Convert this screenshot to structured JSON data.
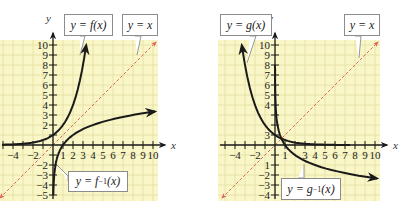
{
  "chart_data": [
    {
      "type": "line",
      "title": "",
      "xlabel": "x",
      "ylabel": "y",
      "xlim": [
        -5,
        10
      ],
      "ylim": [
        -5,
        10
      ],
      "grid": true,
      "x_ticks": [
        -4,
        -2,
        1,
        2,
        3,
        4,
        5,
        6,
        7,
        8,
        9,
        10
      ],
      "y_ticks": [
        -5,
        -4,
        -3,
        -2,
        2,
        3,
        4,
        5,
        6,
        7,
        8,
        9,
        10
      ],
      "series": [
        {
          "name": "y = f(x)",
          "kind": "exponential",
          "base": 2,
          "x": [
            -5,
            -4,
            -3,
            -2,
            -1,
            0,
            1,
            2,
            3,
            3.32
          ],
          "y": [
            0.03,
            0.06,
            0.13,
            0.25,
            0.5,
            1,
            2,
            4,
            8,
            10
          ]
        },
        {
          "name": "y = f^-1(x)",
          "kind": "logarithmic",
          "base": 2,
          "x": [
            0.03,
            0.06,
            0.13,
            0.25,
            0.5,
            1,
            2,
            4,
            8,
            10
          ],
          "y": [
            -5,
            -4,
            -3,
            -2,
            -1,
            0,
            1,
            2,
            3,
            3.32
          ]
        },
        {
          "name": "y = x",
          "kind": "reference",
          "style": "dashed",
          "color": "#e0655a",
          "x": [
            -5,
            10
          ],
          "y": [
            -5,
            10
          ]
        }
      ],
      "annotations": [
        {
          "text": "y = f(x)",
          "target": "f"
        },
        {
          "text": "y = x",
          "target": "identity"
        },
        {
          "text": "y = f^-1(x)",
          "target": "f-inverse"
        }
      ]
    },
    {
      "type": "line",
      "title": "",
      "xlabel": "x",
      "ylabel": "y",
      "xlim": [
        -5,
        10
      ],
      "ylim": [
        -5,
        10
      ],
      "grid": true,
      "x_ticks": [
        -4,
        -2,
        1,
        3,
        4,
        5,
        6,
        7,
        8,
        9,
        10
      ],
      "y_ticks": [
        -5,
        -4,
        -3,
        -2,
        1,
        4,
        5,
        6,
        7,
        8,
        9,
        10
      ],
      "series": [
        {
          "name": "y = g(x)",
          "kind": "exponential",
          "base": 0.5,
          "x": [
            -3.32,
            -3,
            -2,
            -1,
            0,
            1,
            2,
            3,
            4,
            5,
            6,
            7.5
          ],
          "y": [
            10,
            8,
            4,
            2,
            1,
            0.5,
            0.25,
            0.13,
            0.06,
            0.03,
            0.02,
            0.01
          ]
        },
        {
          "name": "y = g^-1(x)",
          "kind": "logarithmic",
          "base": 0.5,
          "x": [
            0.25,
            0.5,
            1,
            2,
            4,
            8,
            10
          ],
          "y": [
            8,
            1,
            0,
            -1,
            -2,
            -3,
            -3.32
          ]
        },
        {
          "name": "y = x",
          "kind": "reference",
          "style": "dashed",
          "color": "#e0655a",
          "x": [
            -5,
            10
          ],
          "y": [
            -5,
            10
          ]
        }
      ],
      "annotations": [
        {
          "text": "y = g(x)",
          "target": "g"
        },
        {
          "text": "y = x",
          "target": "identity"
        },
        {
          "text": "y = g^-1(x)",
          "target": "g-inverse"
        }
      ]
    }
  ],
  "colors": {
    "grid_background": "#f9f6c8",
    "grid_line": "#e4dfa0",
    "axis": "#1a1a1a",
    "curve": "#1a1a1a",
    "identity_line": "#e0655a"
  },
  "panels": [
    {
      "id": "left",
      "labels": {
        "func": "y = f(x)",
        "identity": "y = x",
        "inverse_prefix": "y = f",
        "inverse_sup": "−1",
        "inverse_suffix": "(x)"
      },
      "axis_labels": {
        "x": "x",
        "y": "y"
      },
      "x_tick_labels": [
        "−4",
        "−2",
        "1",
        "2",
        "3",
        "4",
        "5",
        "6",
        "7",
        "8",
        "9",
        "10"
      ],
      "y_tick_labels": [
        "10",
        "9",
        "8",
        "7",
        "6",
        "5",
        "4",
        "3",
        "2",
        "−2",
        "−3",
        "−4",
        "−5"
      ]
    },
    {
      "id": "right",
      "labels": {
        "func": "y = g(x)",
        "identity": "y = x",
        "inverse_prefix": "y = g",
        "inverse_sup": "−1",
        "inverse_suffix": "(x)"
      },
      "axis_labels": {
        "x": "x",
        "y": "y"
      },
      "x_tick_labels": [
        "−4",
        "−2",
        "1",
        "3",
        "4",
        "5",
        "6",
        "7",
        "8",
        "9",
        "10"
      ],
      "y_tick_labels": [
        "10",
        "9",
        "8",
        "7",
        "6",
        "5",
        "4",
        "3",
        "1",
        "−2",
        "−3",
        "−4",
        "−5"
      ]
    }
  ]
}
